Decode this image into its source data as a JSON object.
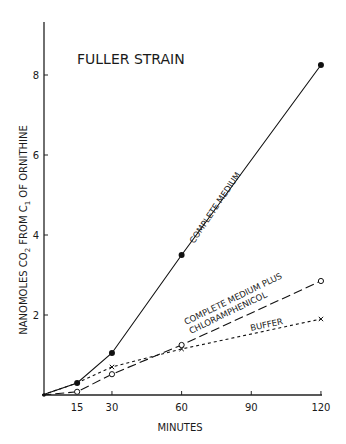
{
  "chart_data": {
    "type": "line",
    "title": "FULLER STRAIN",
    "xlabel": "MINUTES",
    "ylabel": "NANOMOLES CO2 FROM C1 OF ORNITHINE",
    "ylabel_parts": [
      "NANOMOLES CO",
      "2",
      " FROM C",
      "1",
      " OF ORNITHINE"
    ],
    "x_ticks": [
      15,
      30,
      60,
      90,
      120
    ],
    "y_ticks": [
      2,
      4,
      6,
      8
    ],
    "xlim": [
      0,
      120
    ],
    "ylim": [
      0,
      9.2
    ],
    "grid": false,
    "legend": "inline labels",
    "series": [
      {
        "name": "COMPLETE MEDIUM",
        "marker": "filled-circle",
        "line": "solid",
        "x": [
          0,
          15,
          30,
          60,
          120
        ],
        "y": [
          0,
          0.3,
          1.05,
          3.5,
          8.25
        ]
      },
      {
        "name": "COMPLETE MEDIUM PLUS CHLORAMPHENICOL",
        "label_lines": [
          "COMPLETE MEDIUM PLUS",
          "CHLORAMPHENICOL"
        ],
        "marker": "open-circle",
        "line": "long-dash",
        "x": [
          0,
          15,
          30,
          60,
          120
        ],
        "y": [
          0,
          0.08,
          0.52,
          1.25,
          2.85
        ]
      },
      {
        "name": "BUFFER",
        "marker": "x",
        "line": "short-dash",
        "x": [
          0,
          15,
          30,
          60,
          120
        ],
        "y": [
          0,
          0.3,
          0.7,
          1.15,
          1.9
        ]
      }
    ]
  }
}
